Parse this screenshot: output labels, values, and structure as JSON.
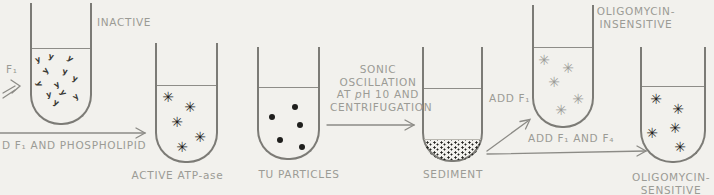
{
  "figure": "mitochondrial ATPase reconstitution diagram",
  "colors": {
    "background": "#f2f1ed",
    "tube_line": "#7c7b76",
    "label_text": "#9b9b95",
    "arrow": "#8c8b86",
    "particle_black": "#1f1f1d",
    "particle_gray": "#9c9c98",
    "squiggle": "#3a3a35"
  },
  "labels": {
    "f1": "F₁",
    "inactive": "INACTIVE",
    "add_f1_phospholipid": "D F₁ AND PHOSPHOLIPID",
    "active_atpase": "ACTIVE ATP-ase",
    "tu_particles": "TU PARTICLES",
    "process_line1": "SONIC",
    "process_line2": "OSCILLATION",
    "process_line3_pre": "AT ",
    "process_line3_italic": "p",
    "process_line3_post": "H 10 AND",
    "process_line4": "CENTRIFUGATION",
    "sediment": "SEDIMENT",
    "add_f1": "ADD F₁",
    "add_f1_f4": "ADD F₁ AND F₄",
    "oligo_insensitive_line1": "OLIGOMYCIN-",
    "oligo_insensitive_line2": "INSENSITIVE",
    "oligo_sensitive_line1": "OLIGOMYCIN-",
    "oligo_sensitive_line2": "SENSITIVE"
  },
  "particles": {
    "inactive": {
      "glyph": "squiggle",
      "color": "#3a3a35",
      "points": [
        [
          38,
          60,
          -20
        ],
        [
          51,
          57,
          15
        ],
        [
          70,
          59,
          40
        ],
        [
          46,
          71,
          -50
        ],
        [
          65,
          72,
          10
        ],
        [
          39,
          84,
          70
        ],
        [
          57,
          85,
          -30
        ],
        [
          75,
          79,
          20
        ],
        [
          49,
          95,
          -10
        ],
        [
          63,
          93,
          55
        ],
        [
          76,
          97,
          -40
        ],
        [
          56,
          103,
          25
        ]
      ]
    },
    "active_atpase": {
      "glyph": "star",
      "color": "#1f1f1d",
      "points": [
        [
          168,
          97
        ],
        [
          190,
          107
        ],
        [
          177,
          122
        ],
        [
          200,
          137
        ],
        [
          182,
          147
        ]
      ]
    },
    "tu_particles": {
      "glyph": "dot",
      "color": "#1f1f1d",
      "points": [
        [
          272,
          117
        ],
        [
          295,
          107
        ],
        [
          300,
          125
        ],
        [
          280,
          140
        ],
        [
          302,
          147
        ]
      ]
    },
    "oligo_insensitive": {
      "glyph": "star",
      "color": "#9c9c98",
      "points": [
        [
          544,
          60
        ],
        [
          568,
          68
        ],
        [
          554,
          82
        ],
        [
          578,
          99
        ],
        [
          561,
          110
        ]
      ]
    },
    "oligo_sensitive": {
      "glyph": "star",
      "color": "#1f1f1d",
      "points": [
        [
          656,
          99
        ],
        [
          678,
          109
        ],
        [
          652,
          133
        ],
        [
          675,
          128
        ],
        [
          680,
          147
        ]
      ]
    }
  }
}
